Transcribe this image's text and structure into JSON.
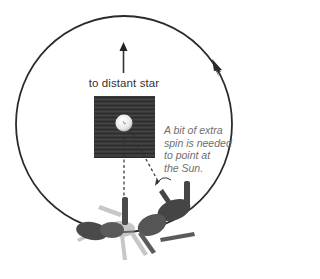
{
  "diagram": {
    "star_label": "to distant star",
    "note_lines": [
      "A bit of extra",
      "spin is needed",
      "to point at",
      "the Sun."
    ],
    "colors": {
      "orbit": "#2b2b2b",
      "arrow": "#333333",
      "board": "#3a3a3a",
      "sun": "#f2f2f2",
      "figure": "#3f3f3f",
      "note_text": "#6e6e6e"
    },
    "elements": {
      "orbit": "circular orbit with direction arrow (counterclockwise at right side)",
      "sun": "white sphere on dark square board",
      "figure": "person lying on back at two orbit positions"
    }
  }
}
